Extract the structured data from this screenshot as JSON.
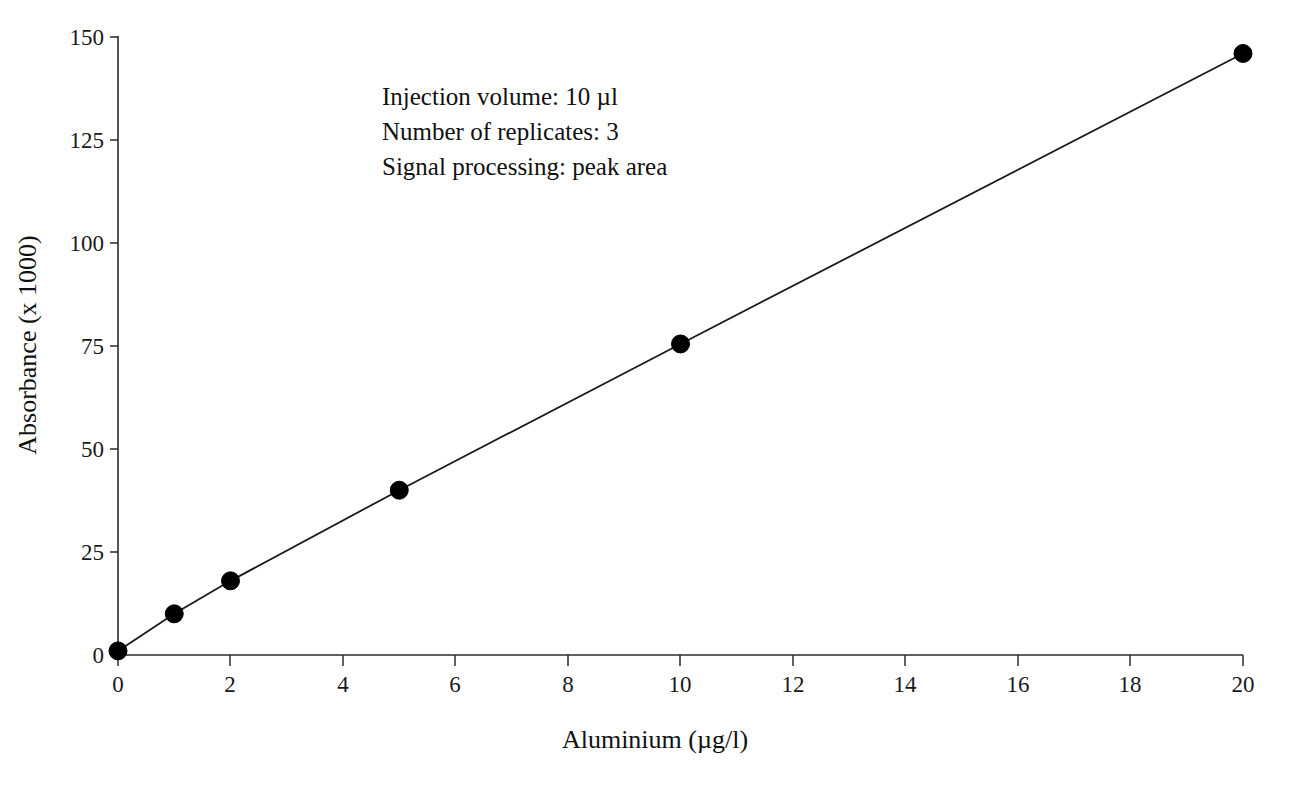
{
  "chart_data": {
    "type": "line",
    "title": "",
    "xlabel": "Aluminium  (µg/l)",
    "ylabel": "Absorbance  (x 1000)",
    "xlim": [
      0,
      20
    ],
    "ylim": [
      0,
      150
    ],
    "grid": false,
    "legend": null,
    "x": [
      0,
      1,
      2,
      5,
      10,
      20
    ],
    "values": [
      1,
      10,
      18,
      40,
      75.5,
      146
    ],
    "series": [
      {
        "name": "Aluminium calibration",
        "x": [
          0,
          1,
          2,
          5,
          10,
          20
        ],
        "values": [
          1,
          10,
          18,
          40,
          75.5,
          146
        ],
        "marker": "filled-circle",
        "color": "#000000"
      }
    ],
    "xticks": [
      0,
      2,
      4,
      6,
      8,
      10,
      12,
      14,
      16,
      18,
      20
    ],
    "xtick_labels": [
      "0",
      "2",
      "4",
      "6",
      "8",
      "10",
      "12",
      "14",
      "16",
      "18",
      "20"
    ],
    "yticks": [
      0,
      25,
      50,
      75,
      100,
      125,
      150
    ],
    "ytick_labels": [
      "0",
      "25",
      "50",
      "75",
      "100",
      "125",
      "150"
    ],
    "annotations": [
      "Injection volume: 10 µl",
      "Number of replicates: 3",
      "Signal processing: peak area"
    ]
  },
  "axes": {
    "x_title": "Aluminium  (µg/l)",
    "y_title": "Absorbance  (x 1000)"
  },
  "annotation_block": {
    "line1": "Injection volume: 10 µl",
    "line2": "Number of replicates: 3",
    "line3": "Signal processing: peak area"
  },
  "ytick_labels": {
    "t0": "0",
    "t1": "25",
    "t2": "50",
    "t3": "75",
    "t4": "100",
    "t5": "125",
    "t6": "150"
  },
  "xtick_labels": {
    "t0": "0",
    "t1": "2",
    "t2": "4",
    "t3": "6",
    "t4": "8",
    "t5": "10",
    "t6": "12",
    "t7": "14",
    "t8": "16",
    "t9": "18",
    "t10": "20"
  }
}
